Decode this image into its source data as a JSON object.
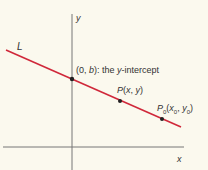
{
  "diagram": {
    "axes": {
      "x_label": "x",
      "y_label": "y"
    },
    "line": {
      "label": "L",
      "color": "#d0283a"
    },
    "points": [
      {
        "id": "y-intercept",
        "label": "(0, b): the y-intercept"
      },
      {
        "id": "P",
        "label": "P(x, y)"
      },
      {
        "id": "P0",
        "label": "P0(x0, y0)"
      }
    ],
    "axis_color": "#666666",
    "point_color": "#222222"
  },
  "labels": {
    "y_axis": "y",
    "x_axis": "x",
    "line_L": "L",
    "intercept_open": "(0, ",
    "intercept_b": "b",
    "intercept_close": "): the ",
    "intercept_y": "y",
    "intercept_rest": "-intercept",
    "p_P": "P",
    "p_coords_open": "(",
    "p_x": "x",
    "p_comma": ", ",
    "p_y": "y",
    "p_close": ")",
    "p0_P": "P",
    "p0_sub": "0",
    "p0_x": "x",
    "p0_y": "y"
  }
}
